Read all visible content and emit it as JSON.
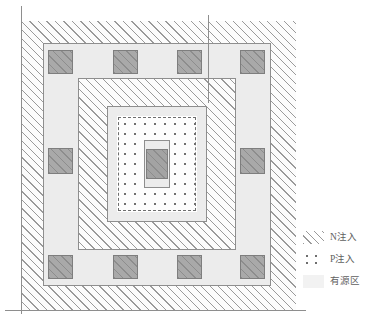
{
  "diagram": {
    "colors": {
      "line": "#8e8e8e",
      "hatch": "#9a9a9a",
      "dot": "#6e6e6e",
      "contact_fill": "#a9a9a9",
      "active_fill": "#ececec",
      "background": "#ffffff"
    },
    "regions": [
      {
        "id": "n-implant-outer",
        "layer": "N注入",
        "fill": "diagonal-hatch"
      },
      {
        "id": "active-ring-outer",
        "layer": "有源区",
        "fill": "solid-light"
      },
      {
        "id": "n-implant-mid",
        "layer": "N注入",
        "fill": "diagonal-hatch"
      },
      {
        "id": "active-ring-inner",
        "layer": "有源区",
        "fill": "solid-light"
      },
      {
        "id": "p-implant-core",
        "layer": "P注入",
        "fill": "dot-array"
      },
      {
        "id": "gate-stack",
        "layer": "有源区",
        "fill": "solid-dark"
      }
    ],
    "contacts": {
      "label": "contact",
      "top_row": 4,
      "bottom_row": 4,
      "left_column": 2,
      "right_column": 2,
      "total": 12
    }
  },
  "legend": {
    "name": "legend",
    "items": [
      {
        "swatch": "diagonal-hatch-swatch",
        "label": "N注入"
      },
      {
        "swatch": "dot-array-swatch",
        "label": "P注入"
      },
      {
        "swatch": "solid-light-swatch",
        "label": "有源区"
      }
    ]
  }
}
